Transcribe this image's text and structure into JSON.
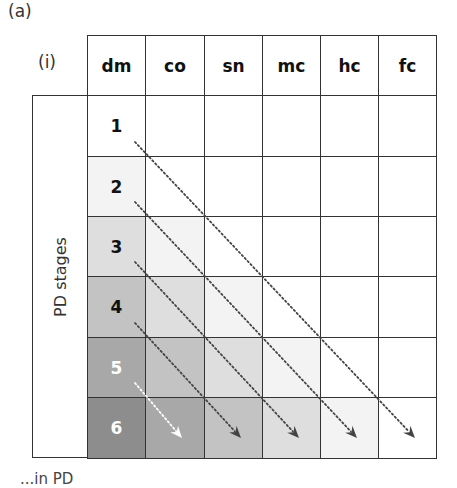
{
  "figure": {
    "panel_label": "(a)",
    "sub_label": "(i)",
    "row_axis_label": "PD stages",
    "caption_fragment": "...in PD"
  },
  "columns": [
    {
      "key": "dm",
      "label": "dm"
    },
    {
      "key": "co",
      "label": "co"
    },
    {
      "key": "sn",
      "label": "sn"
    },
    {
      "key": "mc",
      "label": "mc"
    },
    {
      "key": "hc",
      "label": "hc"
    },
    {
      "key": "fc",
      "label": "fc"
    }
  ],
  "stages": [
    {
      "label": "1"
    },
    {
      "label": "2"
    },
    {
      "label": "3"
    },
    {
      "label": "4"
    },
    {
      "label": "5"
    },
    {
      "label": "6"
    }
  ],
  "shading_levels": [
    "#ffffff",
    "#f3f3f3",
    "#dedede",
    "#c3c3c3",
    "#a8a8a8",
    "#8d8d8d"
  ],
  "arrows": [
    {
      "from_stage": "1",
      "to_column": "fc",
      "color": "#444444"
    },
    {
      "from_stage": "2",
      "to_column": "hc",
      "color": "#444444"
    },
    {
      "from_stage": "3",
      "to_column": "mc",
      "color": "#444444"
    },
    {
      "from_stage": "4",
      "to_column": "sn",
      "color": "#444444"
    },
    {
      "from_stage": "5",
      "to_column": "co",
      "color": "#ffffff"
    }
  ]
}
